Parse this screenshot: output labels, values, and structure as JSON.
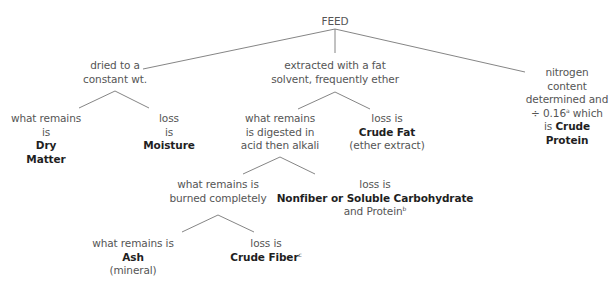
{
  "diagram": {
    "type": "tree",
    "title": "FEED",
    "line_color": "#777777",
    "text_color": "#555555",
    "bold_color": "#1f1f1f",
    "nodes": {
      "root": {
        "label": "FEED"
      },
      "dried": {
        "line1": "dried to a",
        "line2": "constant wt."
      },
      "extracted": {
        "line1": "extracted with a fat",
        "line2": "solvent, frequently ether"
      },
      "nitrogen": {
        "line1": "nitrogen",
        "line2": "content",
        "line3": "determined and",
        "line4_pre": "÷ 0.16",
        "line4_sup": "a",
        "line4_post": " which",
        "line5_pre": "is ",
        "line5_bold": "Crude",
        "line6_bold": "Protein"
      },
      "dry_matter": {
        "line1": "what remains",
        "line2": "is",
        "bold1": "Dry",
        "bold2": "Matter"
      },
      "moisture": {
        "line1": "loss",
        "line2": "is",
        "bold1": "Moisture"
      },
      "digested": {
        "line1": "what remains",
        "line2": "is digested in",
        "line3": "acid then alkali"
      },
      "crude_fat": {
        "line1": "loss is",
        "bold1": "Crude Fat",
        "line2": "(ether extract)"
      },
      "burned": {
        "line1": "what remains is",
        "line2": "burned completely"
      },
      "nonfiber": {
        "line1": "loss is",
        "bold1": "Nonfiber or Soluble Carbohydrate",
        "line2_pre": "and Protein",
        "line2_sup": "b"
      },
      "ash": {
        "line1": "what remains is",
        "bold1": "Ash",
        "line2": "(mineral)"
      },
      "crude_fiber": {
        "line1": "loss is",
        "bold1": "Crude Fiber",
        "sup": "c"
      }
    },
    "edges": [
      [
        "FEED",
        "dried to a constant wt."
      ],
      [
        "FEED",
        "extracted with a fat solvent, frequently ether"
      ],
      [
        "FEED",
        "nitrogen content determined and ÷ 0.16 which is Crude Protein"
      ],
      [
        "dried to a constant wt.",
        "Dry Matter"
      ],
      [
        "dried to a constant wt.",
        "Moisture"
      ],
      [
        "extracted with a fat solvent, frequently ether",
        "what remains is digested in acid then alkali"
      ],
      [
        "extracted with a fat solvent, frequently ether",
        "Crude Fat"
      ],
      [
        "what remains is digested in acid then alkali",
        "what remains is burned completely"
      ],
      [
        "what remains is digested in acid then alkali",
        "Nonfiber or Soluble Carbohydrate and Protein"
      ],
      [
        "what remains is burned completely",
        "Ash"
      ],
      [
        "what remains is burned completely",
        "Crude Fiber"
      ]
    ]
  }
}
